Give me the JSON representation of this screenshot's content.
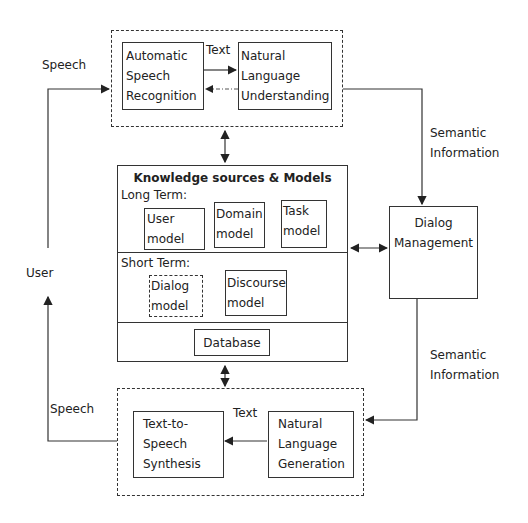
{
  "diagram": {
    "top_group": {
      "asr": "Automatic\nSpeech\nRecognition",
      "nlu": "Natural\nLanguage\nUnderstanding",
      "edge_label": "Text"
    },
    "knowledge": {
      "title": "Knowledge sources & Models",
      "long_term_label": "Long Term:",
      "long_term_models": [
        "User\nmodel",
        "Domain\nmodel",
        "Task\nmodel"
      ],
      "short_term_label": "Short Term:",
      "short_term_models": [
        "Dialog\nmodel",
        "Discourse\nmodel"
      ],
      "database": "Database"
    },
    "dialog_management": "Dialog\nManagement",
    "bottom_group": {
      "tts": "Text-to-\nSpeech\nSynthesis",
      "nlg": "Natural\nLanguage\nGeneration",
      "edge_label": "Text"
    },
    "edge_labels": {
      "speech_in": "Speech",
      "speech_out": "Speech",
      "user": "User",
      "semantic_top": "Semantic\nInformation",
      "semantic_bottom": "Semantic\nInformation"
    }
  }
}
